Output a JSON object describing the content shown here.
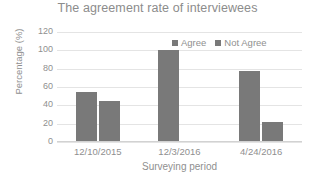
{
  "chart_data": {
    "type": "bar",
    "title": "The agreement rate of interviewees",
    "xlabel": "Surveying period",
    "ylabel": "Percentage (%)",
    "categories": [
      "12/10/2015",
      "12/3/2016",
      "4/24/2016"
    ],
    "series": [
      {
        "name": "Agree",
        "values": [
          55,
          100,
          78
        ],
        "color": "#797979"
      },
      {
        "name": "Not Agree",
        "values": [
          45,
          0,
          22
        ],
        "color": "#797979"
      }
    ],
    "ylim": [
      0,
      120
    ],
    "yticks": [
      0,
      20,
      40,
      60,
      80,
      100,
      120
    ],
    "ytick_labels": [
      "0",
      "20",
      "40",
      "60",
      "80",
      "100",
      "120"
    ],
    "grid": true,
    "grid_axis": "y",
    "legend_position": "top-right-inside",
    "bar_color": "#797979",
    "gridline_color": "#e4e4e4",
    "text_color": "#8f8f8f",
    "title_color": "#8c8c8c",
    "background": "#ffffff"
  }
}
